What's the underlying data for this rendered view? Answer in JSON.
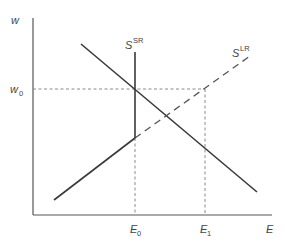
{
  "diagram": {
    "type": "labor-market supply-demand",
    "axes": {
      "y_label": "w",
      "x_label": "E"
    },
    "y_ticks": [
      {
        "label": "w",
        "sub": "0"
      }
    ],
    "x_ticks": [
      {
        "label": "E",
        "sub": "0"
      },
      {
        "label": "E",
        "sub": "1"
      }
    ],
    "curves": {
      "short_run_supply": {
        "label": "S",
        "sup": "SR"
      },
      "long_run_supply": {
        "label": "S",
        "sup": "LR"
      },
      "demand": {
        "label": ""
      }
    },
    "colors": {
      "line": "#3a3a3a",
      "guide": "#8a8a8a",
      "text": "#444444"
    }
  }
}
